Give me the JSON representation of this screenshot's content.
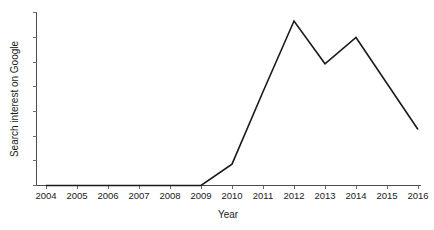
{
  "chart_data": {
    "type": "line",
    "title": "",
    "xlabel": "Year",
    "ylabel": "Search interest on Google",
    "categories": [
      "2004",
      "2005",
      "2006",
      "2007",
      "2008",
      "2009",
      "2010",
      "2011",
      "2012",
      "2013",
      "2014",
      "2015",
      "2016"
    ],
    "x": [
      2004,
      2005,
      2006,
      2007,
      2008,
      2009,
      2010,
      2011,
      2012,
      2013,
      2014,
      2015,
      2016
    ],
    "values": [
      0,
      0,
      0,
      0,
      0,
      0,
      13,
      57,
      100,
      74,
      90,
      62,
      34
    ],
    "series": [
      {
        "name": "Search interest on Google",
        "values": [
          0,
          0,
          0,
          0,
          0,
          0,
          13,
          57,
          100,
          74,
          90,
          62,
          34
        ],
        "color": "#1a1a1a"
      }
    ],
    "xlim": [
      2004,
      2016
    ],
    "ylim": [
      0,
      100
    ],
    "y_tick_labels": [],
    "y_ticks_visible": true,
    "x_ticks_visible": true,
    "grid": false,
    "legend": false,
    "legend_position": "none",
    "markers": false,
    "annotations": []
  },
  "axes": {
    "x_tick_labels": [
      "2004",
      "2005",
      "2006",
      "2007",
      "2008",
      "2009",
      "2010",
      "2011",
      "2012",
      "2013",
      "2014",
      "2015",
      "2016"
    ],
    "x_title": "Year",
    "y_title": "Search interest on Google"
  },
  "style": {
    "background": "#ffffff",
    "line_color": "#1a1a1a",
    "axis_color": "#4d4d4d",
    "tick_color": "#6b6b6b",
    "text_color": "#1a1a1a"
  }
}
